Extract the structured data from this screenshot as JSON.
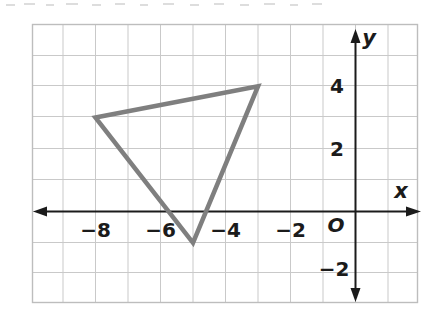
{
  "figure": {
    "axis_labels": {
      "x": "x",
      "y": "y",
      "origin": "O"
    },
    "colors": {
      "grid": "#c9c9c9",
      "frame": "#bdbdbd",
      "axis": "#1b1b1b",
      "shape_stroke": "#7f7f7f",
      "background": "#ffffff"
    }
  },
  "chart_data": {
    "type": "scatter",
    "title": "",
    "xlabel": "x",
    "ylabel": "y",
    "grid": true,
    "legend": "none",
    "xlim": [
      -10,
      2
    ],
    "ylim": [
      -3,
      6
    ],
    "x_ticks": [
      -8,
      -6,
      -4,
      -2
    ],
    "y_ticks": [
      4,
      2,
      -2
    ],
    "x_tick_labels": [
      "−8",
      "−6",
      "−4",
      "−2"
    ],
    "y_tick_labels": [
      "4",
      "2",
      "−2"
    ],
    "origin_label": "O",
    "series": [
      {
        "name": "triangle",
        "kind": "polygon",
        "closed": true,
        "stroke": "#7f7f7f",
        "fill": "none",
        "points": [
          {
            "x": -8,
            "y": 3
          },
          {
            "x": -3,
            "y": 4
          },
          {
            "x": -5,
            "y": -1
          }
        ]
      }
    ]
  }
}
